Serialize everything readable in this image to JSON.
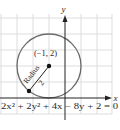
{
  "diagram": {
    "type": "circle-on-coordinate-grid",
    "axes": {
      "x_label": "x",
      "y_label": "y"
    },
    "center": {
      "label": "(−1, 2)",
      "x": -1,
      "y": 2
    },
    "radius": {
      "label_word": "Radius",
      "label_value": "2",
      "value": 2
    },
    "equation": "2x² + 2y² + 4x − 8y + 2 = 0",
    "colors": {
      "grid": "#d4d4d4",
      "axis": "#222222",
      "circle": "#6a6a6a",
      "point": "#111111",
      "text": "#2a2a2a"
    }
  }
}
